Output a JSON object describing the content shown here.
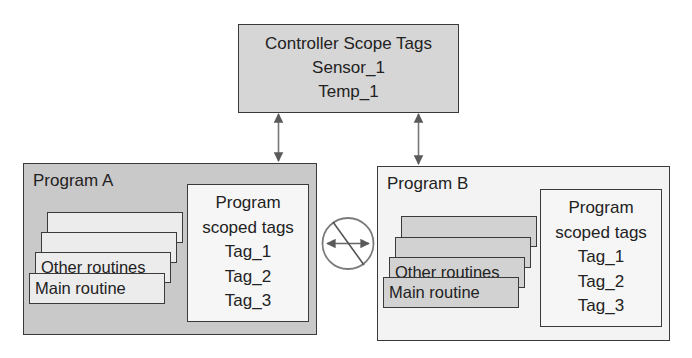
{
  "controller": {
    "title": "Controller Scope Tags",
    "tags": [
      "Sensor_1",
      "Temp_1"
    ]
  },
  "program_a": {
    "title": "Program A",
    "routines": [
      "",
      "",
      "Other routines",
      "Main routine"
    ],
    "tags_box": {
      "title_line1": "Program",
      "title_line2": "scoped tags",
      "tags": [
        "Tag_1",
        "Tag_2",
        "Tag_3"
      ]
    }
  },
  "program_b": {
    "title": "Program B",
    "routines": [
      "",
      "",
      "Other routines",
      "Main routine"
    ],
    "tags_box": {
      "title_line1": "Program",
      "title_line2": "scoped tags",
      "tags": [
        "Tag_1",
        "Tag_2",
        "Tag_3"
      ]
    }
  },
  "connectors": {
    "controller_to_program_a": "bidirectional",
    "controller_to_program_b": "bidirectional",
    "program_a_to_program_b": "prohibited"
  },
  "colors": {
    "line": "#3a3a3a",
    "arrow": "#6a6a6a",
    "controller_fill": "#d6d6d6",
    "program_a_fill": "#c9c9c9",
    "program_b_fill": "#f3f3f3"
  }
}
